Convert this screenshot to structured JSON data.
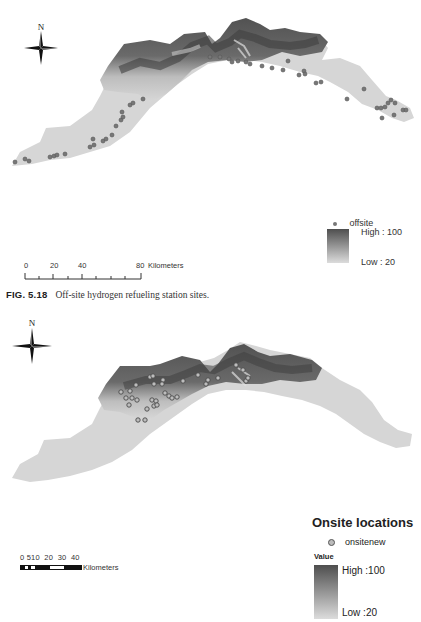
{
  "figure1": {
    "north_label": "N",
    "legend": {
      "point_label": "offsite",
      "ramp_high": "High : 100",
      "ramp_low": "Low : 20",
      "ramp_colors": [
        "#4e4e4e",
        "#dcdcdc"
      ],
      "point_color": "#777777"
    },
    "scale_bar": {
      "ticks": [
        "0",
        "20",
        "40",
        "80"
      ],
      "unit": "Kilometers"
    },
    "caption": {
      "label": "FIG. 5.18",
      "text": "Off-site hydrogen refueling station sites."
    }
  },
  "figure2": {
    "north_label": "N",
    "legend": {
      "title": "Onsite locations",
      "point_label": "onsitenew",
      "value_heading": "Value",
      "ramp_high": "High :100",
      "ramp_low": "Low :20",
      "ramp_colors": [
        "#4e4e4e",
        "#dcdcdc"
      ],
      "point_color": "#bbbbbb"
    },
    "scale_bar": {
      "ticks": [
        "0",
        "5",
        "10",
        "20",
        "30",
        "40"
      ],
      "tick_text": "0 510  20  30  40",
      "unit": "Kilometers"
    }
  }
}
